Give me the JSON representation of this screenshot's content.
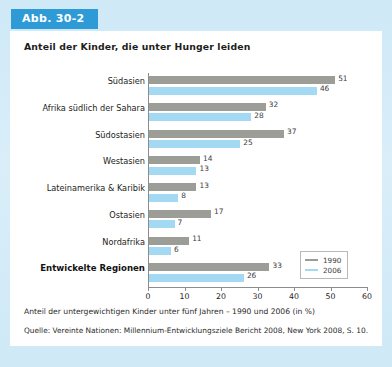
{
  "badge": {
    "label": "Abb. 30-2"
  },
  "panel": {
    "title": "Anteil der Kinder, die unter Hunger leiden",
    "note": "Anteil der untergewichtigen Kinder unter fünf Jahren – 1990 und 2006 (in %)",
    "source": "Quelle: Vereinte Nationen: Millennium-Entwicklungsziele Bericht 2008, New York 2008, S. 10."
  },
  "legend": {
    "position": "bottom-right-inside",
    "entries": [
      {
        "name": "1990",
        "color": "#9d9d98"
      },
      {
        "name": "2006",
        "color": "#a3d9f2"
      }
    ]
  },
  "colors": {
    "badge_bg": "#2e9bd6",
    "page_bg": "#d3ecf8",
    "panel_bg": "#ffffff",
    "bar_1990": "#9d9d98",
    "bar_2006": "#a3d9f2",
    "axis": "#8c8c8c"
  },
  "chart_data": {
    "type": "bar",
    "orientation": "horizontal",
    "title": "Anteil der Kinder, die unter Hunger leiden",
    "subtitle": "Anteil der untergewichtigen Kinder unter fünf Jahren – 1990 und 2006 (in %)",
    "xlabel": "",
    "ylabel": "",
    "xlim": [
      0,
      60
    ],
    "xticks": [
      0,
      10,
      20,
      30,
      40,
      50,
      60
    ],
    "grid": false,
    "categories": [
      "Südasien",
      "Afrika südlich der Sahara",
      "Südostasien",
      "Westasien",
      "Lateinamerika & Karibik",
      "Ostasien",
      "Nordafrika",
      "Entwickelte Regionen"
    ],
    "emphasized_categories": [
      "Entwickelte Regionen"
    ],
    "series": [
      {
        "name": "1990",
        "color": "#9d9d98",
        "values": [
          51,
          32,
          37,
          14,
          13,
          17,
          11,
          33
        ]
      },
      {
        "name": "2006",
        "color": "#a3d9f2",
        "values": [
          46,
          28,
          25,
          13,
          8,
          7,
          6,
          26
        ]
      }
    ]
  }
}
